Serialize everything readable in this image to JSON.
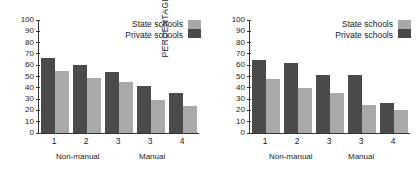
{
  "chart_data": [
    {
      "type": "bar",
      "panel": "left",
      "title": "",
      "xlabel": "",
      "ylabel": "PERCENTAGE",
      "ylim": [
        0,
        100
      ],
      "yticks": [
        0,
        10,
        20,
        30,
        40,
        50,
        60,
        70,
        80,
        90,
        100
      ],
      "grid": false,
      "categories": [
        "1",
        "2",
        "3",
        "3",
        "4"
      ],
      "group_labels": [
        "Non-manual",
        "Manual"
      ],
      "legend_position": "top-right",
      "series": [
        {
          "name": "Private schools",
          "color": "#4a4a4a",
          "values": [
            66,
            60,
            54,
            42,
            35
          ]
        },
        {
          "name": "State schools",
          "color": "#a9a9a9",
          "values": [
            55,
            49,
            45,
            29,
            24
          ]
        }
      ]
    },
    {
      "type": "bar",
      "panel": "right",
      "title": "",
      "xlabel": "",
      "ylabel": "PERCENTAGE",
      "ylim": [
        0,
        100
      ],
      "yticks": [
        0,
        10,
        20,
        30,
        40,
        50,
        60,
        70,
        80,
        90,
        100
      ],
      "grid": false,
      "categories": [
        "1",
        "2",
        "3",
        "3",
        "4"
      ],
      "group_labels": [
        "Non-manual",
        "Manual"
      ],
      "legend_position": "top-right",
      "series": [
        {
          "name": "Private schools",
          "color": "#4a4a4a",
          "values": [
            65,
            62,
            51,
            51,
            27
          ]
        },
        {
          "name": "State schools",
          "color": "#a9a9a9",
          "values": [
            48,
            40,
            35,
            25,
            20
          ]
        }
      ]
    }
  ],
  "left": {
    "ylabel": "PERCENTAGE",
    "yticks": [
      "100",
      "90",
      "80",
      "70",
      "60",
      "50",
      "40",
      "30",
      "20",
      "10",
      "0"
    ],
    "xticks": [
      "1",
      "2",
      "3",
      "3",
      "4"
    ],
    "groups": {
      "nonmanual": "Non-manual",
      "manual": "Manual"
    },
    "legend": {
      "state": "State schools",
      "private": "Private schools"
    }
  },
  "right": {
    "ylabel": "PERCENTAGE",
    "yticks": [
      "100",
      "90",
      "80",
      "70",
      "60",
      "50",
      "40",
      "30",
      "20",
      "10",
      "0"
    ],
    "xticks": [
      "1",
      "2",
      "3",
      "3",
      "4"
    ],
    "groups": {
      "nonmanual": "Non-manual",
      "manual": "Manual"
    },
    "legend": {
      "state": "State schools",
      "private": "Private schools"
    }
  },
  "colors": {
    "state": "#a9a9a9",
    "private": "#4a4a4a",
    "axis": "#333333",
    "text": "#1a1a1a",
    "background": "#ffffff"
  }
}
